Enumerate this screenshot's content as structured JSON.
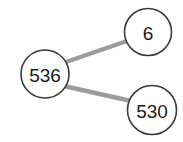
{
  "figure": {
    "type": "number-bond",
    "title": "",
    "background_color": "#ffffff",
    "circle_stroke_color": "#3a3a3a",
    "circle_fill_color": "#ffffff",
    "circle_stroke_width": 1.6,
    "line_color": "#9c9c9c",
    "line_width": 4.4,
    "text_color": "#1a1a1a"
  },
  "nodes": {
    "whole": {
      "label": "536",
      "role": "whole",
      "cx": 45,
      "cy": 74,
      "r": 24,
      "font_size": 19
    },
    "part_top": {
      "label": "6",
      "role": "part",
      "cx": 148,
      "cy": 32,
      "r": 23.5,
      "font_size": 19
    },
    "part_bottom": {
      "label": "530",
      "role": "part",
      "cx": 152,
      "cy": 110,
      "r": 24.5,
      "font_size": 19
    }
  },
  "connectors": [
    {
      "name": "whole-to-part-top",
      "x1": 66,
      "y1": 62,
      "x2": 127,
      "y2": 41
    },
    {
      "name": "whole-to-part-bottom",
      "x1": 64,
      "y1": 86,
      "x2": 131,
      "y2": 101
    }
  ]
}
